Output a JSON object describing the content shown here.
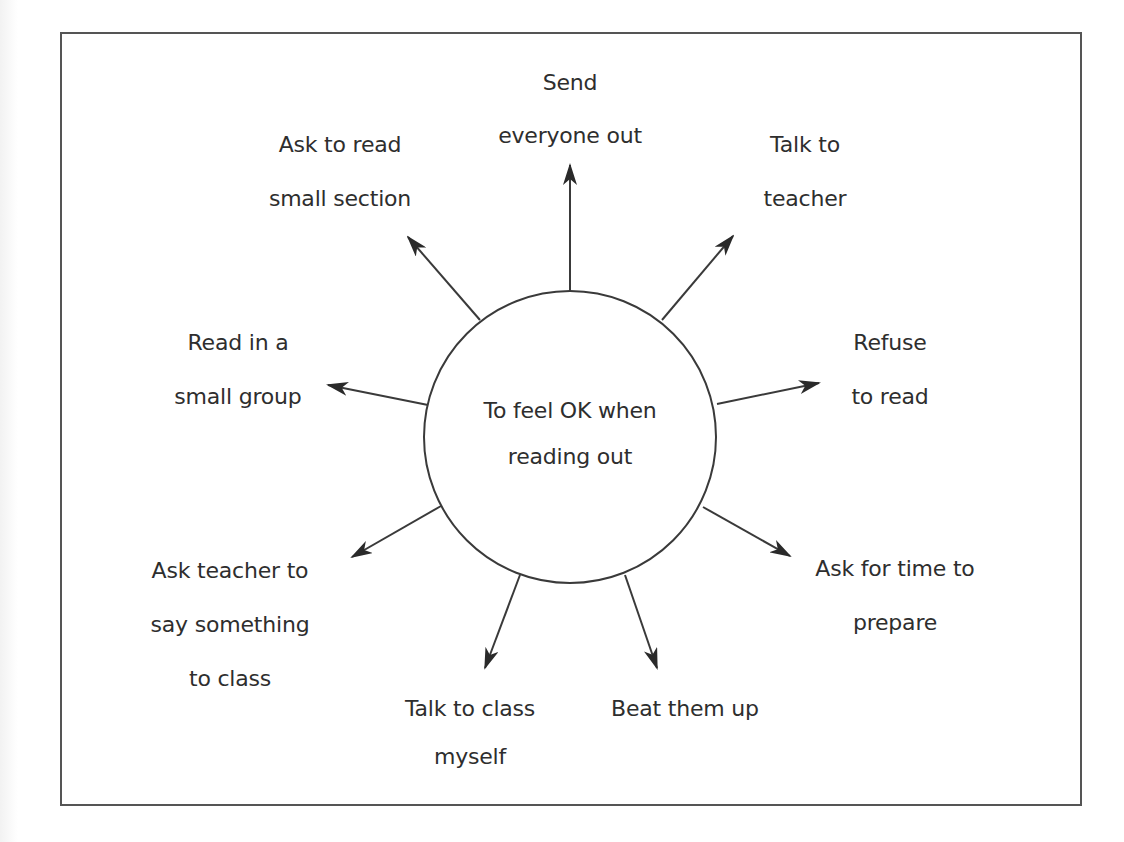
{
  "diagram": {
    "type": "radial-mind-map",
    "colors": {
      "stroke": "#3a3a3a",
      "text": "#2e2e2e",
      "background": "#ffffff",
      "frame": "#555555"
    },
    "center": {
      "id": "goal",
      "lines": [
        "To feel OK when",
        "reading out"
      ]
    },
    "nodes": [
      {
        "id": "send-everyone-out",
        "lines": [
          "Send",
          "everyone out"
        ],
        "position": "top"
      },
      {
        "id": "talk-to-teacher",
        "lines": [
          "Talk to",
          "teacher"
        ],
        "position": "upper-right"
      },
      {
        "id": "refuse-to-read",
        "lines": [
          "Refuse",
          "to read"
        ],
        "position": "right"
      },
      {
        "id": "ask-for-time-to-prepare",
        "lines": [
          "Ask for time to",
          "prepare"
        ],
        "position": "lower-right"
      },
      {
        "id": "beat-them-up",
        "lines": [
          "Beat them up"
        ],
        "position": "bottom-right"
      },
      {
        "id": "talk-to-class-myself",
        "lines": [
          "Talk to class",
          "myself"
        ],
        "position": "bottom-left"
      },
      {
        "id": "ask-teacher-to-say-something",
        "lines": [
          "Ask teacher to",
          "say something",
          "to class"
        ],
        "position": "lower-left"
      },
      {
        "id": "read-in-small-group",
        "lines": [
          "Read in a",
          "small group"
        ],
        "position": "left"
      },
      {
        "id": "ask-to-read-small-section",
        "lines": [
          "Ask to read",
          "small section"
        ],
        "position": "upper-left"
      }
    ],
    "edges": [
      {
        "from": "goal",
        "to": "send-everyone-out",
        "arrow": "to"
      },
      {
        "from": "goal",
        "to": "talk-to-teacher",
        "arrow": "to"
      },
      {
        "from": "goal",
        "to": "refuse-to-read",
        "arrow": "to"
      },
      {
        "from": "goal",
        "to": "ask-for-time-to-prepare",
        "arrow": "to"
      },
      {
        "from": "goal",
        "to": "beat-them-up",
        "arrow": "to"
      },
      {
        "from": "goal",
        "to": "talk-to-class-myself",
        "arrow": "to"
      },
      {
        "from": "goal",
        "to": "ask-teacher-to-say-something",
        "arrow": "to"
      },
      {
        "from": "goal",
        "to": "read-in-small-group",
        "arrow": "to"
      },
      {
        "from": "goal",
        "to": "ask-to-read-small-section",
        "arrow": "to"
      }
    ]
  }
}
